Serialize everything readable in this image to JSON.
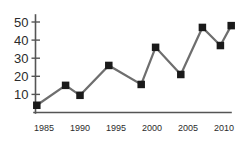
{
  "chart_data": {
    "type": "line",
    "title": "",
    "subtitle": "",
    "xlabel": "",
    "ylabel": "",
    "xlim": [
      1982.5,
      2012.5
    ],
    "ylim": [
      0,
      53
    ],
    "grid": false,
    "legend": null,
    "marker": "square",
    "line_color": "#6e6e6e",
    "marker_color": "#1a1a1a",
    "axis_color": "#555555",
    "background": "#ffffff",
    "y_ticks": [
      10,
      20,
      30,
      40,
      50
    ],
    "y_tick_labels": [
      "10",
      "20",
      "30",
      "40",
      "50"
    ],
    "x_ticks": [
      1985,
      1990,
      1995,
      2000,
      2005,
      2010
    ],
    "x_tick_labels": [
      "1985",
      "1990",
      "1995",
      "2000",
      "2005",
      "2010"
    ],
    "x": [
      1984,
      1988,
      1990,
      1994,
      1998.5,
      2000.5,
      2004,
      2007,
      2009.5,
      2011
    ],
    "values": [
      4,
      15,
      9.5,
      26,
      15.5,
      36,
      21,
      47,
      37,
      48
    ],
    "points": [
      {
        "x": 1984,
        "y": 4
      },
      {
        "x": 1988,
        "y": 15
      },
      {
        "x": 1990,
        "y": 9.5
      },
      {
        "x": 1994,
        "y": 26
      },
      {
        "x": 1998.5,
        "y": 15.5
      },
      {
        "x": 2000.5,
        "y": 36
      },
      {
        "x": 2004,
        "y": 21
      },
      {
        "x": 2007,
        "y": 47
      },
      {
        "x": 2009.5,
        "y": 37
      },
      {
        "x": 2011,
        "y": 48
      }
    ]
  }
}
